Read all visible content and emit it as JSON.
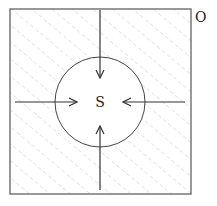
{
  "diagram": {
    "region_label": "O",
    "center_label": "S",
    "colors": {
      "stroke": "#444444",
      "hatch": "#c8c8c8",
      "background": "#ffffff",
      "circle_fill": "#ffffff"
    },
    "square": {
      "x": 10,
      "y": 9,
      "width": 181,
      "height": 185
    },
    "circle": {
      "cx": 100,
      "cy": 102,
      "r": 45
    },
    "arrows": [
      {
        "name": "arrow-from-top",
        "x1": 100,
        "y1": 10,
        "x2": 100,
        "y2": 78
      },
      {
        "name": "arrow-from-bottom",
        "x1": 100,
        "y1": 190,
        "x2": 100,
        "y2": 126
      },
      {
        "name": "arrow-from-left",
        "x1": 15,
        "y1": 102,
        "x2": 77,
        "y2": 102
      },
      {
        "name": "arrow-from-right",
        "x1": 185,
        "y1": 102,
        "x2": 123,
        "y2": 102
      }
    ],
    "hatch": {
      "style": "dashed diagonal lines",
      "angle_deg": 50,
      "spacing_px": 13
    }
  }
}
